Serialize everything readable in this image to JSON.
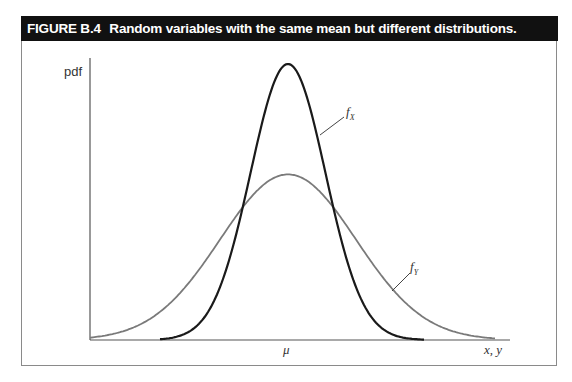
{
  "figure": {
    "number": "FIGURE B.4",
    "caption": "Random variables with the same mean but different distributions."
  },
  "chart_data": {
    "type": "line",
    "title": "Random variables with the same mean but different distributions.",
    "xlabel": "x, y",
    "ylabel": "pdf",
    "x_tick_labels": [
      "μ"
    ],
    "grid": false,
    "legend": "inline labels",
    "series": [
      {
        "name": "f_X",
        "description": "narrow, tall bell curve centered at μ",
        "color": "#1a1a1a",
        "relative_peak": 1.0,
        "relative_spread": 0.55
      },
      {
        "name": "f_Y",
        "description": "wide, short bell curve centered at μ",
        "color": "#7a7a7a",
        "relative_peak": 0.6,
        "relative_spread": 1.0
      }
    ],
    "annotations": [
      {
        "text": "f_X",
        "points_to": "f_X right flank"
      },
      {
        "text": "f_Y",
        "points_to": "f_Y right tail"
      }
    ]
  },
  "labels": {
    "y_axis": "pdf",
    "x_axis": "x, y",
    "mean": "μ",
    "fx_main": "f",
    "fx_sub": "X",
    "fy_main": "f",
    "fy_sub": "Y"
  }
}
